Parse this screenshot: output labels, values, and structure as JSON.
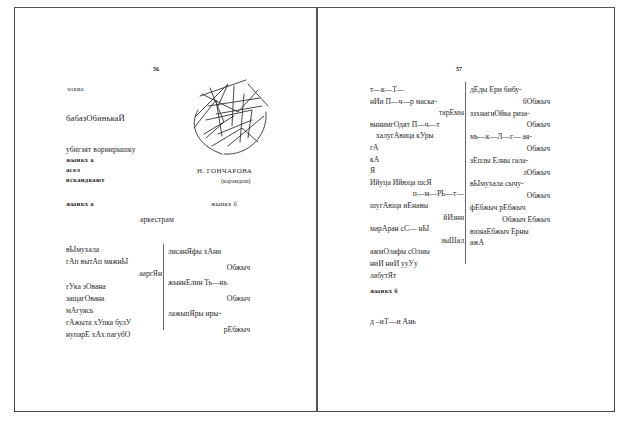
{
  "left_page": {
    "page_number": "56",
    "heading_small": "зохна",
    "title": "бабазОбинькаЙ",
    "subtitle_line": "убигзят вориирышку",
    "label_a1": "жынкх а",
    "line_asel": "асел",
    "line_vskan": "вскандвают",
    "illustration_caption": "Н. ГОНЧАРОВА",
    "illustration_subcaption": "(карандаш)",
    "section_left": "жынкх а",
    "section_right": "жынкх б",
    "center_heading": "аркестрам",
    "col1": [
      "вЫмухала",
      "гАп  вытАп  мяжнЫ",
      "ааргЯн",
      "гУка  эОвана",
      "защагОвана",
      "мАгуясь",
      "гАжыта  хУпка  булУ",
      "нупарЕ  хАх  пагубО"
    ],
    "col2": [
      "лисянЯфы  хАни",
      "Обжыч",
      "жыянЕлин  Ть—нь",
      "Обжыч",
      "лажыпЯры  иры-",
      "рЕбжыч"
    ]
  },
  "right_page": {
    "page_number": "57",
    "col1": [
      "т—к—Т—",
      "нИи  П—ч—р  маска-",
      "тарЕмы",
      "вннимгОдят  П—ч—т",
      "халугАвица  кУры",
      "гА",
      "кА",
      "Я",
      "Ийуца  Ийюца  шсЯ",
      "п—м—РЬ—т—",
      "шугАюца  иЕнавы",
      "йИзни",
      "марАран  сС—  нЫ",
      "зыШал",
      "ажмОлафы  сОлны",
      "ниИ  ниИ  ууУу",
      "лабутЯт"
    ],
    "col2": [
      "дЕды  Ери  бибу-",
      "бОбжыч",
      "ззхнагиОйка  риза-",
      "Обжыч",
      "мь—к—Л—г—  ая-",
      "Обжыч",
      "зЕплы  Елны  гала-",
      "лОбжыч",
      "вЫмухала  сычу-",
      "Обжыч",
      "фЕбжыч  рЕбжыч",
      "Обжыч  Ебжыч",
      "юпяаЕбжыч  Ерны",
      "ажА"
    ],
    "section_label": "жынкх б",
    "final_line": "д –иТ—и  Ань"
  }
}
